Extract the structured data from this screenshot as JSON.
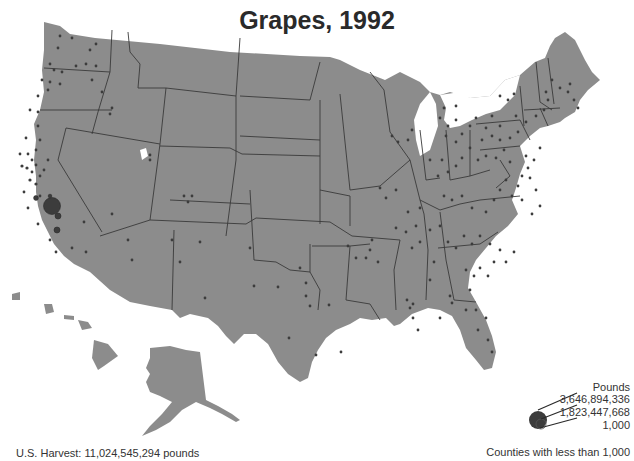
{
  "title": "Grapes, 1992",
  "footer": {
    "harvest": "U.S. Harvest: 11,024,545,294 pounds"
  },
  "legend": {
    "title": "Pounds",
    "values": [
      "3,646,894,336",
      "1,823,447,668",
      "1,000"
    ],
    "note": "Counties with less than 1,000"
  },
  "colors": {
    "land": "#8c8c8c",
    "border": "#3a3a3a",
    "dot": "#3c3c3c",
    "water": "#ffffff",
    "text": "#333333"
  },
  "map_data": {
    "type": "proportional-symbol",
    "region": "United States (counties)",
    "measure": "Grape harvest, pounds",
    "year": 1992,
    "largest_cluster": "Central California (San Joaquin Valley)"
  }
}
